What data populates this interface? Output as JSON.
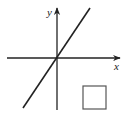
{
  "figure": {
    "x_axis_label": "x",
    "y_axis_label": "y",
    "line": {
      "passes_through_origin": true,
      "slope_sign": "positive"
    },
    "answer_box": {
      "content": ""
    },
    "colors": {
      "stroke": "#222222",
      "box": "#555555",
      "background": "#ffffff"
    }
  }
}
